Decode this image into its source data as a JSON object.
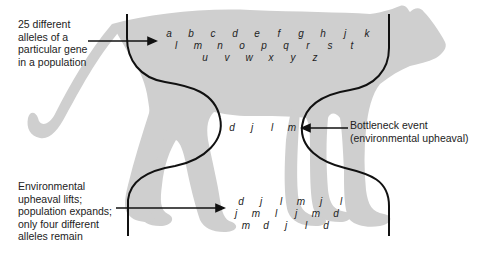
{
  "figure": {
    "colors": {
      "silhouette": "#cfcfcf",
      "line": "#111111",
      "text": "#222222",
      "background": "#ffffff"
    }
  },
  "labels": {
    "original_population": [
      "25 different",
      "alleles of a",
      "particular gene",
      "in a population"
    ],
    "bottleneck": [
      "Bottleneck event",
      "(environmental upheaval)"
    ],
    "recovered_population": [
      "Environmental",
      "upheaval lifts;",
      "population expands;",
      "only four different",
      "alleles remain"
    ]
  },
  "alleles": {
    "original": [
      [
        "a",
        "b",
        "c",
        "d",
        "e",
        "f",
        "g",
        "h",
        "j",
        "k"
      ],
      [
        "l",
        "m",
        "n",
        "o",
        "p",
        "q",
        "r",
        "s",
        "t"
      ],
      [
        "u",
        "v",
        "w",
        "x",
        "y",
        "z"
      ]
    ],
    "bottleneck": [
      [
        "d",
        "j",
        "l",
        "m"
      ]
    ],
    "recovered": [
      [
        "d",
        "j",
        "l",
        "m",
        "j",
        "l"
      ],
      [
        "j",
        "m",
        "l",
        "j",
        "m",
        "d"
      ],
      [
        "m",
        "d",
        "j",
        "l",
        "d"
      ]
    ]
  }
}
